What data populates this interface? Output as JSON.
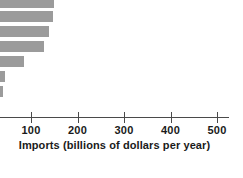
{
  "chart_data": {
    "type": "bar",
    "orientation": "horizontal",
    "title": "",
    "subtitle": "",
    "xlabel": "Imports (billions of dollars per year)",
    "ylabel": "",
    "xlim": [
      0,
      540
    ],
    "ylim": [
      0,
      7
    ],
    "grid": false,
    "legend": null,
    "xticks": [
      100,
      200,
      300,
      400,
      500
    ],
    "xtick_labels": [
      "100",
      "200",
      "300",
      "400",
      "500"
    ],
    "categories": [
      "",
      "",
      "",
      "",
      "",
      "",
      ""
    ],
    "values": [
      116,
      113,
      106,
      95,
      52,
      11,
      6
    ],
    "bar_color": "#9b9b9b",
    "axis_color": "#4a4a4a",
    "note": "top bar is cropped by the figure edge"
  },
  "axis": {
    "label": "Imports (billions of dollars per year)",
    "ticks": [
      {
        "value": "100",
        "x": 31
      },
      {
        "value": "200",
        "x": 77.5
      },
      {
        "value": "300",
        "x": 124
      },
      {
        "value": "400",
        "x": 170.5
      },
      {
        "value": "500",
        "x": 217
      }
    ]
  },
  "bars": [
    {
      "name": "bar-1",
      "y": 0,
      "height": 8,
      "width": 54
    },
    {
      "name": "bar-2",
      "y": 11,
      "height": 11,
      "width": 53
    },
    {
      "name": "bar-3",
      "y": 26,
      "height": 11,
      "width": 49
    },
    {
      "name": "bar-4",
      "y": 41,
      "height": 11,
      "width": 44
    },
    {
      "name": "bar-5",
      "y": 56,
      "height": 11,
      "width": 24
    },
    {
      "name": "bar-6",
      "y": 71,
      "height": 11,
      "width": 5
    },
    {
      "name": "bar-7",
      "y": 86,
      "height": 11,
      "width": 3
    }
  ]
}
